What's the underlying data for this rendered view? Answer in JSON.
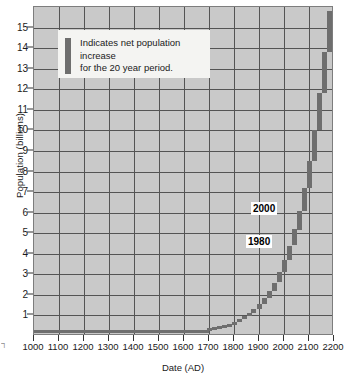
{
  "chart_data": {
    "type": "bar",
    "title": "",
    "xlabel": "Date (AD)",
    "ylabel": "Population (billions)",
    "xlim": [
      1000,
      2200
    ],
    "ylim": [
      0,
      16
    ],
    "grid": true,
    "xticks": [
      1000,
      1100,
      1200,
      1300,
      1400,
      1500,
      1600,
      1700,
      1800,
      1900,
      2000,
      2100,
      2200
    ],
    "yticks": [
      1,
      2,
      3,
      4,
      5,
      6,
      7,
      8,
      9,
      10,
      11,
      12,
      13,
      14,
      15
    ],
    "xtick_labels": [
      "1000",
      "1100",
      "1200",
      "1300",
      "1400",
      "1500",
      "1600",
      "1700",
      "1800",
      "1900",
      "2000",
      "2100",
      "2200"
    ],
    "ytick_labels": [
      "1",
      "2",
      "3",
      "4",
      "5",
      "6",
      "7",
      "8",
      "9",
      "10",
      "11",
      "12",
      "13",
      "14",
      "15"
    ],
    "series_name": "World population",
    "bar_description": "Each vertical bar spans the net population increase over a 20 year period",
    "baseline_value": 0.31,
    "baseline_x_range": [
      1000,
      1700
    ],
    "x": [
      1700,
      1720,
      1740,
      1760,
      1780,
      1800,
      1820,
      1840,
      1860,
      1880,
      1900,
      1920,
      1940,
      1960,
      1980,
      2000,
      2020,
      2040,
      2060,
      2080,
      2100,
      2120,
      2140,
      2160,
      2180
    ],
    "values": [
      0.33,
      0.37,
      0.42,
      0.47,
      0.53,
      0.6,
      0.7,
      0.82,
      0.95,
      1.1,
      1.3,
      1.55,
      1.85,
      2.2,
      2.6,
      3.1,
      3.7,
      4.4,
      5.2,
      6.1,
      7.2,
      8.5,
      10.0,
      11.8,
      13.8
    ],
    "values_end": [
      0.37,
      0.42,
      0.47,
      0.53,
      0.6,
      0.7,
      0.82,
      0.95,
      1.1,
      1.3,
      1.55,
      1.85,
      2.2,
      2.6,
      3.1,
      3.7,
      4.4,
      5.2,
      6.1,
      7.2,
      8.5,
      10.0,
      11.8,
      13.8,
      15.8
    ],
    "annotations": [
      {
        "label": "2000",
        "x": 2000,
        "y": 6.2
      },
      {
        "label": "1980",
        "x": 1980,
        "y": 4.55
      }
    ],
    "legend": {
      "position": "upper-left-inside",
      "swatch_color": "#6e6e6e",
      "text_line1": "Indicates net population increase",
      "text_line2": "for the 20 year period."
    },
    "colors": {
      "plot_background": "#c9c9c9",
      "gridline": "#545454",
      "bar": "#6e6e6e",
      "axis_text": "#1a1a1a",
      "legend_background": "#f4f4f2"
    }
  },
  "edge_glyph": "┐"
}
